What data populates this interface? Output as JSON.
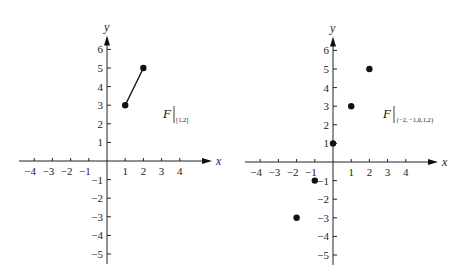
{
  "chart_data": [
    {
      "type": "line",
      "title": "F|[1,2]",
      "label": {
        "main": "F",
        "subscript": "[1,2]"
      },
      "xlabel": "x",
      "ylabel": "y",
      "xlim": [
        -4,
        4
      ],
      "ylim": [
        -5,
        6
      ],
      "x_ticks": [
        "-4",
        "-3",
        "-2",
        "-1",
        "1",
        "2",
        "3",
        "4"
      ],
      "y_ticks": [
        "6",
        "5",
        "4",
        "3",
        "2",
        "1",
        "-1",
        "-2",
        "-3",
        "-4",
        "-5"
      ],
      "grid": false,
      "series": [
        {
          "name": "F restricted to [1,2]",
          "style": "segment-with-endpoints",
          "points": [
            [
              1,
              3
            ],
            [
              2,
              5
            ]
          ]
        }
      ]
    },
    {
      "type": "scatter",
      "title": "F|{-2,-1,0,1,2}",
      "label": {
        "main": "F",
        "subscript": "{−2, −1,0,1,2}"
      },
      "xlabel": "x",
      "ylabel": "y",
      "xlim": [
        -4,
        4
      ],
      "ylim": [
        -5,
        6
      ],
      "x_ticks": [
        "-4",
        "-3",
        "-2",
        "-1",
        "1",
        "2",
        "3",
        "4"
      ],
      "y_ticks": [
        "6",
        "5",
        "4",
        "3",
        "2",
        "1",
        "-1",
        "-2",
        "-3",
        "-4",
        "-5"
      ],
      "grid": false,
      "series": [
        {
          "name": "F restricted to {-2,-1,0,1,2}",
          "style": "points",
          "points": [
            [
              -2,
              -3
            ],
            [
              -1,
              -1
            ],
            [
              0,
              1
            ],
            [
              1,
              3
            ],
            [
              2,
              5
            ]
          ]
        }
      ]
    }
  ],
  "plots": {
    "left": {
      "axis_x_label": "x",
      "axis_y_label": "y",
      "fn_main": "F",
      "fn_sub": "[1,2]",
      "x_tick_labels": [
        "−4",
        "−3",
        "−2",
        "−1",
        "1",
        "2",
        "3",
        "4"
      ],
      "y_tick_labels_pos": [
        "6",
        "5",
        "4",
        "3",
        "2",
        "1"
      ],
      "y_tick_labels_neg": [
        "−1",
        "−2",
        "−3",
        "−4",
        "−5"
      ]
    },
    "right": {
      "axis_x_label": "x",
      "axis_y_label": "y",
      "fn_main": "F",
      "fn_sub": "{−2, −1,0,1,2}",
      "x_tick_labels": [
        "−4",
        "−3",
        "−2",
        "−1",
        "1",
        "2",
        "3",
        "4"
      ],
      "y_tick_labels_pos": [
        "6",
        "5",
        "4",
        "3",
        "2",
        "1"
      ],
      "y_tick_labels_neg": [
        "−1",
        "−2",
        "−3",
        "−4",
        "−5"
      ]
    }
  }
}
